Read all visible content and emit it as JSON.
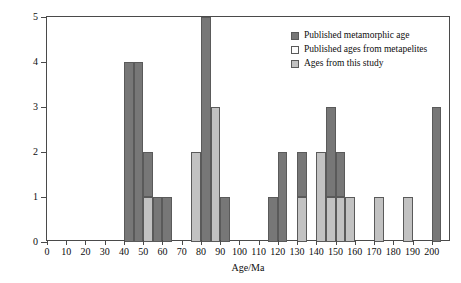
{
  "chart_data": {
    "type": "bar",
    "title": "",
    "xlabel": "Age/Ma",
    "ylabel": "Frequency of reported metamorphic age",
    "xlim": [
      0,
      210
    ],
    "ylim": [
      0,
      5
    ],
    "xticks": [
      0,
      10,
      20,
      30,
      40,
      50,
      60,
      70,
      80,
      90,
      100,
      110,
      120,
      130,
      140,
      150,
      160,
      170,
      180,
      190,
      200
    ],
    "yticks": [
      0,
      1,
      2,
      3,
      4,
      5
    ],
    "grid": false,
    "bin_width": 5,
    "stacked": true,
    "legend_position": "top-right",
    "series": [
      {
        "name": "Published metamorphic age",
        "color": "#777777",
        "bins": [
          {
            "x0": 40,
            "x1": 45,
            "value": 4
          },
          {
            "x0": 45,
            "x1": 50,
            "value": 4
          },
          {
            "x0": 50,
            "x1": 55,
            "value": 2
          },
          {
            "x0": 55,
            "x1": 60,
            "value": 1
          },
          {
            "x0": 60,
            "x1": 65,
            "value": 1
          },
          {
            "x0": 75,
            "x1": 80,
            "value": 1
          },
          {
            "x0": 80,
            "x1": 85,
            "value": 5
          },
          {
            "x0": 90,
            "x1": 95,
            "value": 1
          },
          {
            "x0": 115,
            "x1": 120,
            "value": 1
          },
          {
            "x0": 120,
            "x1": 125,
            "value": 2
          },
          {
            "x0": 130,
            "x1": 135,
            "value": 2
          },
          {
            "x0": 145,
            "x1": 150,
            "value": 1
          },
          {
            "x0": 150,
            "x1": 155,
            "value": 3
          },
          {
            "x0": 155,
            "x1": 160,
            "value": 2
          },
          {
            "x0": 200,
            "x1": 205,
            "value": 3
          }
        ]
      },
      {
        "name": "Published ages from metapelites",
        "color": "#fdfdfd",
        "bins": []
      },
      {
        "name": "Ages from this study",
        "color": "#c2c2c2",
        "bins": [
          {
            "x0": 50,
            "x1": 55,
            "value": 1
          },
          {
            "x0": 75,
            "x1": 80,
            "value": 2
          },
          {
            "x0": 85,
            "x1": 90,
            "value": 3
          },
          {
            "x0": 130,
            "x1": 135,
            "value": 1
          },
          {
            "x0": 140,
            "x1": 145,
            "value": 2
          },
          {
            "x0": 145,
            "x1": 150,
            "value": 1
          },
          {
            "x0": 150,
            "x1": 155,
            "value": 1
          },
          {
            "x0": 155,
            "x1": 160,
            "value": 1
          },
          {
            "x0": 170,
            "x1": 175,
            "value": 1
          },
          {
            "x0": 185,
            "x1": 190,
            "value": 1
          }
        ]
      }
    ],
    "bars": [
      {
        "x0": 40,
        "x1": 45,
        "base": 0,
        "top": 4,
        "series": "Published metamorphic age"
      },
      {
        "x0": 45,
        "x1": 50,
        "base": 0,
        "top": 4,
        "series": "Published metamorphic age"
      },
      {
        "x0": 50,
        "x1": 55,
        "base": 0,
        "top": 1,
        "series": "Ages from this study"
      },
      {
        "x0": 50,
        "x1": 55,
        "base": 1,
        "top": 2,
        "series": "Published metamorphic age"
      },
      {
        "x0": 55,
        "x1": 60,
        "base": 0,
        "top": 1,
        "series": "Published metamorphic age"
      },
      {
        "x0": 60,
        "x1": 65,
        "base": 0,
        "top": 1,
        "series": "Published metamorphic age"
      },
      {
        "x0": 75,
        "x1": 80,
        "base": 0,
        "top": 2,
        "series": "Ages from this study"
      },
      {
        "x0": 80,
        "x1": 85,
        "base": 0,
        "top": 5,
        "series": "Published metamorphic age"
      },
      {
        "x0": 85,
        "x1": 90,
        "base": 0,
        "top": 3,
        "series": "Ages from this study"
      },
      {
        "x0": 90,
        "x1": 95,
        "base": 0,
        "top": 1,
        "series": "Published metamorphic age"
      },
      {
        "x0": 115,
        "x1": 120,
        "base": 0,
        "top": 1,
        "series": "Published metamorphic age"
      },
      {
        "x0": 120,
        "x1": 125,
        "base": 0,
        "top": 2,
        "series": "Published metamorphic age"
      },
      {
        "x0": 130,
        "x1": 135,
        "base": 0,
        "top": 1,
        "series": "Ages from this study"
      },
      {
        "x0": 130,
        "x1": 135,
        "base": 1,
        "top": 2,
        "series": "Published metamorphic age"
      },
      {
        "x0": 140,
        "x1": 145,
        "base": 0,
        "top": 2,
        "series": "Ages from this study"
      },
      {
        "x0": 145,
        "x1": 150,
        "base": 0,
        "top": 1,
        "series": "Ages from this study"
      },
      {
        "x0": 145,
        "x1": 150,
        "base": 1,
        "top": 3,
        "series": "Published metamorphic age"
      },
      {
        "x0": 150,
        "x1": 155,
        "base": 0,
        "top": 1,
        "series": "Ages from this study"
      },
      {
        "x0": 150,
        "x1": 155,
        "base": 1,
        "top": 2,
        "series": "Published metamorphic age"
      },
      {
        "x0": 155,
        "x1": 160,
        "base": 0,
        "top": 1,
        "series": "Ages from this study"
      },
      {
        "x0": 170,
        "x1": 175,
        "base": 0,
        "top": 1,
        "series": "Ages from this study"
      },
      {
        "x0": 185,
        "x1": 190,
        "base": 0,
        "top": 1,
        "series": "Ages from this study"
      },
      {
        "x0": 200,
        "x1": 205,
        "base": 0,
        "top": 3,
        "series": "Published metamorphic age"
      }
    ]
  },
  "legend": {
    "items": [
      {
        "label": "Published metamorphic age",
        "color": "#777777"
      },
      {
        "label": "Published ages from metapelites",
        "color": "#fdfdfd"
      },
      {
        "label": "Ages from this study",
        "color": "#c2c2c2"
      }
    ]
  }
}
